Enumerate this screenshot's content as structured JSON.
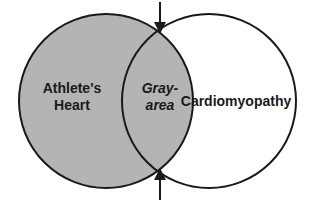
{
  "diagram": {
    "type": "venn",
    "left_circle": {
      "label_line1": "Athlete's",
      "label_line2": "Heart",
      "fill": "#b4b4b4"
    },
    "right_circle": {
      "label": "Cardiomyopathy",
      "fill": "#ffffff"
    },
    "overlap": {
      "label_line1": "Gray-",
      "label_line2": "area",
      "fill": "#b4b4b4"
    },
    "arrows": {
      "top": "down-arrow",
      "bottom": "up-arrow"
    },
    "stroke_color": "#1a1a1a"
  }
}
